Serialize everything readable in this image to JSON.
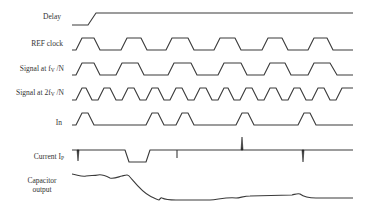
{
  "diagram": {
    "type": "timing-diagram",
    "signals": [
      {
        "id": "delay",
        "label": "Delay",
        "sub": ""
      },
      {
        "id": "ref_clock",
        "label": "REF clock",
        "sub": ""
      },
      {
        "id": "signal_fv",
        "label_pre": "Signal at  f",
        "sub": "V",
        "label_post": " /N"
      },
      {
        "id": "signal_2fv",
        "label_pre": "Signal at  2f",
        "sub": "V",
        "label_post": " /N"
      },
      {
        "id": "in",
        "label": "In",
        "sub": ""
      },
      {
        "id": "current_ip",
        "label_pre": "Current  I",
        "sub": "P",
        "label_post": ""
      },
      {
        "id": "capacitor",
        "label_line1": "Capacitor",
        "label_line2": "output"
      }
    ],
    "colors": {
      "stroke": "#3a3a3a",
      "text": "#333333",
      "background": "#ffffff"
    }
  },
  "waveforms": {
    "delay": "M72,25 L88,25 L96,13 L353,13",
    "ref_clock": "M72,50 L76,50 L82,38 L94,38 L100,50 L121,50 L127,38 L141,38 L147,50 L166,50 L172,38 L188,38 L194,50 L214,50 L220,38 L235,38 L241,50 L262,50 L268,38 L282,38 L288,50 L308,50 L314,38 L327,38 L333,50 L353,50",
    "signal_fv": "M72,75 L76,75 L82,63 L94,63 L100,75 L116,75 L122,63 L138,63 L144,75 L168,75 L174,63 L191,63 L197,75 L218,75 L224,63 L241,63 L247,75 L264,75 L270,63 L285,63 L291,75 L308,75 L314,63 L330,63 L337,75 L353,75",
    "signal_2fv": "M72,100 L76,100 L82,88 L86,88 L92,100 L98,100 L104,88 L110,88 L116,100 L122,100 L128,88 L134,88 L140,100 L146,100 L152,88 L158,88 L164,100 L170,100 L176,88 L182,88 L188,100 L194,100 L200,88 L206,88 L212,100 L218,100 L224,88 L228,88 L234,100 L240,100 L246,88 L252,88 L258,100 L264,100 L270,88 L276,88 L282,100 L288,100 L294,88 L300,88 L306,100 L312,100 L318,88 L324,88 L330,100 L336,100 L342,88 L353,88",
    "in": "M72,125 L76,125 L82,113 L88,113 L94,125 L146,125 L152,113 L158,113 L164,125 L176,125 L182,113 L188,113 L194,125 L236,125 L242,113 L248,113 L254,125 L298,125 L304,113 L310,113 L316,125 L353,125",
    "current_ip": "M72,150 L125,150 L129,162 L146,162 L150,150 L353,150",
    "current_tick": "M177,150 L177,158",
    "spike_down_1": "M77,150 L79,150 L78,161 Z",
    "spike_up": "M241,150 L243,150 L242,137 Z",
    "spike_down_2": "M302,150 L304,150 L303,162 Z",
    "capacitor": "M72,174 C78,175 82,177 86,176 C90,175 94,176 98,175 C102,174 106,176 110,178 C114,179 118,177 122,176 C126,175 128,174 130,177 C136,184 142,192 150,196 C154,198 157,200 159,200 C160,199 161,197 162,198 C164,199 168,200 176,200 L210,200 C220,199 228,197 236,198 C240,198 244,196 250,196 L292,195 C296,194 298,193 300,194 C304,197 308,198 316,198 L353,198"
  }
}
